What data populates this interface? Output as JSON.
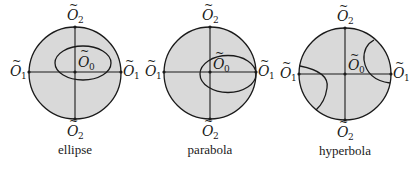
{
  "figure": {
    "panels": [
      {
        "caption": "ellipse",
        "labels": {
          "top": "O",
          "top_sub": "2",
          "bottom": "O",
          "bottom_sub": "2",
          "left": "O",
          "left_sub": "1",
          "right": "O",
          "right_sub": "1",
          "center": "O",
          "center_sub": "0"
        },
        "tilde": "~"
      },
      {
        "caption": "parabola",
        "labels": {
          "top": "O",
          "top_sub": "2",
          "bottom": "O",
          "bottom_sub": "2",
          "left": "O",
          "left_sub": "1",
          "right": "O",
          "right_sub": "1",
          "center": "O",
          "center_sub": "0"
        },
        "tilde": "~"
      },
      {
        "caption": "hyperbola",
        "labels": {
          "top": "O",
          "top_sub": "2",
          "bottom": "O",
          "bottom_sub": "2",
          "left": "O",
          "left_sub": "1",
          "right": "O",
          "right_sub": "1",
          "center": "O",
          "center_sub": "0"
        },
        "tilde": "~"
      }
    ],
    "colors": {
      "disk_fill": "#d9d9d9",
      "stroke": "#1a1a1a"
    }
  }
}
